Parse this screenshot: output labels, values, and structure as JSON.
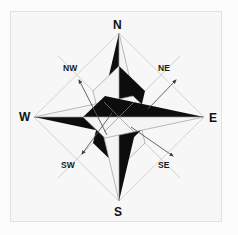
{
  "figure": {
    "background_color": "#fcfcfc",
    "frame_color": "#e2e2e2",
    "plot_background_color": "#f7f7f7"
  },
  "compass": {
    "center": {
      "x": 119,
      "y": 117
    },
    "star_fill_dark": "#0d0d0d",
    "star_fill_light": "#f4f4f4",
    "star_outline": "#9a9a9a",
    "ray_color": "#b9b9b9",
    "arrow_color": "#4a4a4a",
    "points": [
      {
        "id": "north",
        "abbr": "N",
        "name": "North",
        "bearing_degrees": 0,
        "type": "cardinal",
        "label_x": 113,
        "label_y": 19,
        "tip_x": 119,
        "tip_y": 33,
        "dark_half": "left"
      },
      {
        "id": "east",
        "abbr": "E",
        "name": "East",
        "bearing_degrees": 90,
        "type": "cardinal",
        "label_x": 209,
        "label_y": 112,
        "tip_x": 204,
        "tip_y": 117,
        "dark_half": "top"
      },
      {
        "id": "south",
        "abbr": "S",
        "name": "South",
        "bearing_degrees": 180,
        "type": "cardinal",
        "label_x": 114,
        "label_y": 206,
        "tip_x": 119,
        "tip_y": 201,
        "dark_half": "right"
      },
      {
        "id": "west",
        "abbr": "W",
        "name": "West",
        "bearing_degrees": 270,
        "type": "cardinal",
        "label_x": 19,
        "label_y": 111,
        "tip_x": 34,
        "tip_y": 117,
        "dark_half": "bottom"
      },
      {
        "id": "northeast",
        "abbr": "NE",
        "name": "Northeast",
        "bearing_degrees": 45,
        "type": "ordinal",
        "label_x": 158,
        "label_y": 64,
        "arrow_from_x": 148,
        "arrow_from_y": 109,
        "arrow_to_x": 176,
        "arrow_to_y": 80
      },
      {
        "id": "northwest",
        "abbr": "NW",
        "name": "Northwest",
        "bearing_degrees": 315,
        "type": "ordinal",
        "label_x": 63,
        "label_y": 64,
        "arrow_from_x": 107,
        "arrow_from_y": 135,
        "arrow_to_x": 79,
        "arrow_to_y": 80
      },
      {
        "id": "southeast",
        "abbr": "SE",
        "name": "Southeast",
        "bearing_degrees": 135,
        "type": "ordinal",
        "label_x": 158,
        "label_y": 161,
        "arrow_from_x": 131,
        "arrow_from_y": 127,
        "arrow_to_x": 173,
        "arrow_to_y": 156
      },
      {
        "id": "southwest",
        "abbr": "SW",
        "name": "Southwest",
        "bearing_degrees": 225,
        "type": "ordinal",
        "label_x": 61,
        "label_y": 161,
        "arrow_from_x": 112,
        "arrow_from_y": 113,
        "arrow_to_x": 82,
        "arrow_to_y": 154
      }
    ]
  }
}
